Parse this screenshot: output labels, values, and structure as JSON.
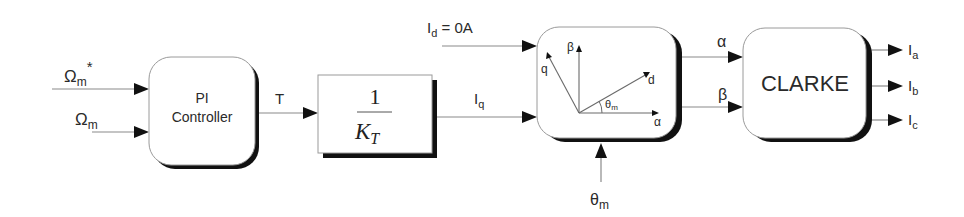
{
  "diagram": {
    "title": "",
    "blocks": {
      "pi_controller": {
        "line1": "PI",
        "line2": "Controller"
      },
      "torque_gain": {
        "numerator": "1",
        "denominator": "K",
        "denominator_sub": "T"
      },
      "park_inverse": {
        "axes": {
          "beta": "β",
          "alpha": "α",
          "q": "q",
          "d": "d",
          "theta": "θ",
          "theta_sub": "m"
        }
      },
      "clarke": {
        "label": "CLARKE"
      }
    },
    "signals": {
      "speed_ref": {
        "symbol": "Ω",
        "sub": "m",
        "sup": "*"
      },
      "speed_meas": {
        "symbol": "Ω",
        "sub": "m"
      },
      "torque": {
        "label": "T"
      },
      "id": {
        "symbol": "I",
        "sub": "d",
        "rest": " = 0A"
      },
      "iq": {
        "symbol": "I",
        "sub": "q"
      },
      "theta_in": {
        "symbol": "θ",
        "sub": "m"
      },
      "alpha_out": {
        "label": "α"
      },
      "beta_out": {
        "label": "β"
      },
      "ia": {
        "symbol": "I",
        "sub": "a"
      },
      "ib": {
        "symbol": "I",
        "sub": "b"
      },
      "ic": {
        "symbol": "I",
        "sub": "c"
      }
    },
    "colors": {
      "block_fill": "#ffffff",
      "shadow": "#111111",
      "wire": "#8a8a8a",
      "text": "#2a2a2a"
    }
  }
}
